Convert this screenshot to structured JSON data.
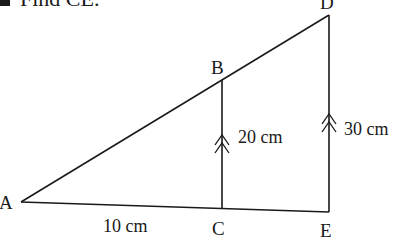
{
  "question": {
    "marker": "a",
    "text": "Find CE."
  },
  "diagram": {
    "points": {
      "A": {
        "label": "A",
        "x": 21,
        "y": 202
      },
      "B": {
        "label": "B",
        "x": 222,
        "y": 80
      },
      "C": {
        "label": "C",
        "x": 222,
        "y": 209
      },
      "D": {
        "label": "D",
        "x": 329,
        "y": 15
      },
      "E": {
        "label": "E",
        "x": 329,
        "y": 212
      }
    },
    "measurements": {
      "AC": "10 cm",
      "BC": "20 cm",
      "DE": "30 cm"
    },
    "parallel_marks": "double-arrow on BC and DE",
    "stroke_color": "#1a1a1a",
    "background": "#ffffff"
  }
}
